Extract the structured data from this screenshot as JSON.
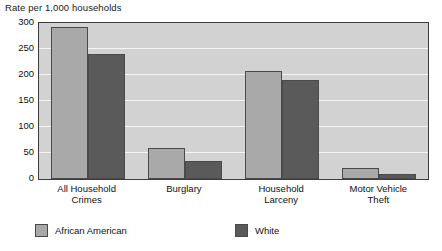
{
  "chart_data": {
    "type": "bar",
    "title": "Rate per 1,000 households",
    "xlabel": "",
    "ylabel": "",
    "ylim": [
      0,
      300
    ],
    "yticks": [
      0,
      50,
      100,
      150,
      200,
      250,
      300
    ],
    "ytick_labels": [
      "0",
      "50",
      "100",
      "150",
      "200",
      "250",
      "300"
    ],
    "grid": "horizontal",
    "legend_position": "bottom",
    "categories": [
      "All Household\nCrimes",
      "Burglary",
      "Household\nLarceny",
      "Motor Vehicle\nTheft"
    ],
    "category_lines": [
      [
        "All Household",
        "Crimes"
      ],
      [
        "Burglary"
      ],
      [
        "Household",
        "Larceny"
      ],
      [
        "Motor Vehicle",
        "Theft"
      ]
    ],
    "series": [
      {
        "name": "African American",
        "color": "#a9a9a9",
        "values": [
          293,
          60,
          207,
          22
        ]
      },
      {
        "name": "White",
        "color": "#5a5a5a",
        "values": [
          240,
          35,
          190,
          10
        ]
      }
    ]
  },
  "colors": {
    "plot_background": "#d2d2d2",
    "gridline": "#f4f4f4",
    "axis_border": "#3c3c3c",
    "bar_border": "#4a4a4a",
    "text": "#111111",
    "page_background": "#ffffff"
  }
}
